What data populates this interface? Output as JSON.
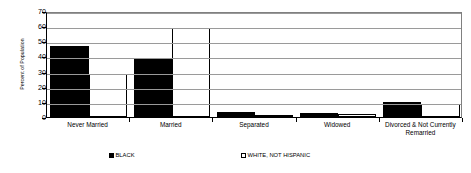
{
  "chart_data": {
    "type": "bar",
    "title": "",
    "xlabel": "",
    "ylabel": "Percent of Population",
    "ylim": [
      0,
      70
    ],
    "ytick_step": 10,
    "yticks": [
      70,
      60,
      50,
      40,
      30,
      20,
      10,
      0
    ],
    "grid": true,
    "legend_position": "bottom",
    "categories": [
      "Never Married",
      "Married",
      "Separated",
      "Widowed",
      "Divorced & Not Currently Remarried"
    ],
    "series": [
      {
        "name": "BLACK",
        "color": "#000000",
        "values": [
          47,
          38,
          3.2,
          2.6,
          9.6
        ]
      },
      {
        "name": "WHITE, NOT HISPANIC",
        "color": "#ffffff",
        "values": [
          28.5,
          59,
          1.2,
          2.2,
          8.8
        ]
      }
    ]
  },
  "axis": {
    "y_title": "Percent of Population",
    "y_tick_labels": [
      "70",
      "60",
      "50",
      "40",
      "30",
      "20",
      "10",
      "0"
    ],
    "x_tick_labels": [
      "Never Married",
      "Married",
      "Separated",
      "Widowed",
      "Divorced & Not Currently\nRemarried"
    ]
  },
  "legend": {
    "items": [
      {
        "label": "BLACK",
        "swatch": "filled-black-square"
      },
      {
        "label": "WHITE, NOT HISPANIC",
        "swatch": "outlined-white-square"
      }
    ]
  },
  "colors": {
    "series_black": "#000000",
    "series_white": "#ffffff",
    "gridline": "#9a9a9a",
    "axis": "#000000",
    "background": "#ffffff"
  }
}
